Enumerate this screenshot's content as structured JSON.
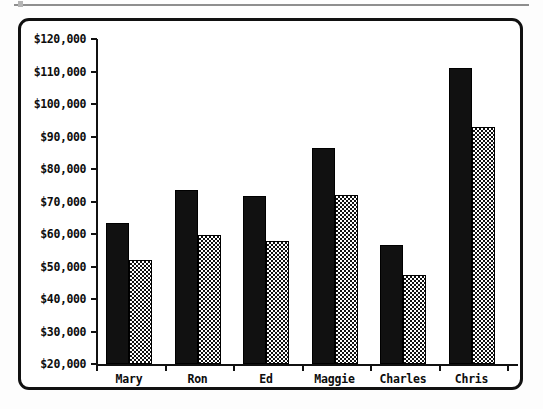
{
  "page": {
    "background_color": "#ffffff",
    "frame_border_color": "#111111",
    "rule_color": "#8e8e8e"
  },
  "chart_data": {
    "type": "bar",
    "title": "",
    "subtitle": "",
    "xlabel": "",
    "ylabel": "",
    "categories": [
      "Mary",
      "Ron",
      "Ed",
      "Maggie",
      "Charles",
      "Chris"
    ],
    "series": [
      {
        "name": "Series 1",
        "style": "solid-black",
        "color": "#111111",
        "values": [
          63400,
          73500,
          71700,
          86500,
          56600,
          111000
        ]
      },
      {
        "name": "Series 2",
        "style": "checkerboard",
        "color": "#111111",
        "values": [
          52000,
          59700,
          57800,
          72000,
          47400,
          93000
        ]
      }
    ],
    "ylim": [
      20000,
      120000
    ],
    "ytick_step": 10000,
    "ytick_labels": [
      "$120,000",
      "$110,000",
      "$100,000",
      "$90,000",
      "$80,000",
      "$70,000",
      "$60,000",
      "$50,000",
      "$40,000",
      "$30,000",
      "$20,000"
    ],
    "ytick_values": [
      120000,
      110000,
      100000,
      90000,
      80000,
      70000,
      60000,
      50000,
      40000,
      30000,
      20000
    ],
    "grid": false,
    "legend": "none",
    "annotations": []
  }
}
